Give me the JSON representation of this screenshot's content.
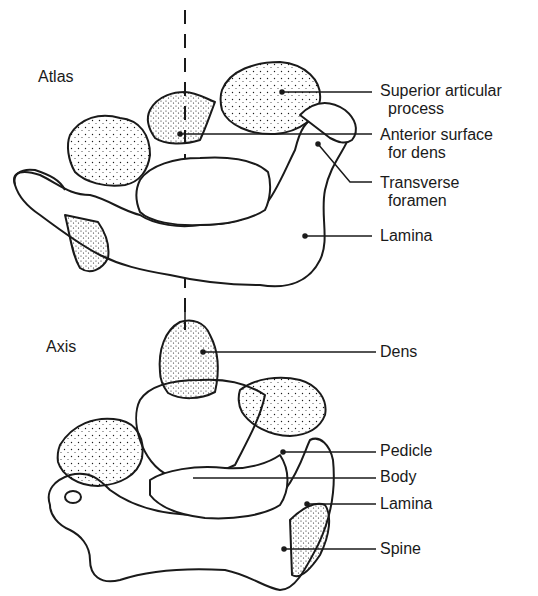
{
  "figure": {
    "atlas": {
      "title": "Atlas",
      "labels": [
        {
          "line1": "Superior articular",
          "line2": "process"
        },
        {
          "line1": "Anterior surface",
          "line2": "for dens"
        },
        {
          "line1": "Transverse",
          "line2": "foramen"
        },
        {
          "line1": "Lamina",
          "line2": ""
        }
      ]
    },
    "axis": {
      "title": "Axis",
      "labels": [
        {
          "line1": "Dens"
        },
        {
          "line1": "Pedicle"
        },
        {
          "line1": "Body"
        },
        {
          "line1": "Lamina"
        },
        {
          "line1": "Spine"
        }
      ]
    },
    "colors": {
      "ink": "#1a1a1a",
      "paper": "#ffffff"
    }
  }
}
